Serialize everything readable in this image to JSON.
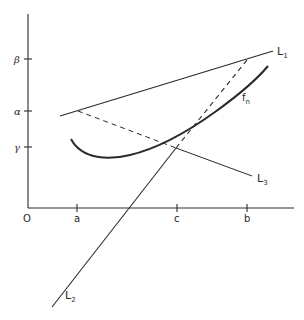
{
  "figure": {
    "type": "geometric-diagram",
    "axes": {
      "origin_label": "O",
      "x_ticks": [
        {
          "label": "a",
          "x": 77
        },
        {
          "label": "c",
          "x": 177
        },
        {
          "label": "b",
          "x": 247
        }
      ],
      "y_ticks": [
        {
          "label": "β",
          "y": 59
        },
        {
          "label": "α",
          "y": 111
        },
        {
          "label": "γ",
          "y": 147
        }
      ]
    },
    "lines": [
      {
        "name": "L1",
        "label_main": "L",
        "label_sub": "1",
        "style": "solid"
      },
      {
        "name": "L2",
        "label_main": "L",
        "label_sub": "2",
        "style": "solid"
      },
      {
        "name": "L3",
        "label_main": "L",
        "label_sub": "3",
        "style": "solid"
      }
    ],
    "curve": {
      "name": "f_n",
      "label_main": "f",
      "label_sub": "n",
      "style": "thick solid"
    },
    "dashed_segments": [
      {
        "from": "L1 at α",
        "to": "vertex (c, γ)"
      },
      {
        "from": "vertex (c, γ)",
        "to": "L1 at b"
      }
    ]
  },
  "colors": {
    "ink": "#2a2a2a",
    "background": "#ffffff"
  }
}
